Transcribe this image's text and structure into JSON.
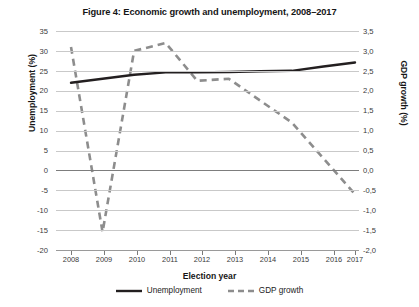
{
  "title": "Figure 4: Economic growth and unemployment, 2008–2017",
  "axes": {
    "x_title": "Election year",
    "y_left_title": "Unemployment (%)",
    "y_right_title": "GDP growth (%)",
    "x_ticklabels": [
      "2008",
      "2009",
      "2010",
      "2011",
      "2012",
      "2013",
      "2014",
      "2015",
      "2016",
      "2017"
    ],
    "y_left_ticklabels": [
      "35",
      "30",
      "25",
      "20",
      "15",
      "10",
      "5",
      "0",
      "-5",
      "-10",
      "-15",
      "-20"
    ],
    "y_right_ticklabels": [
      "3,5",
      "3,0",
      "2,5",
      "2,0",
      "1,5",
      "1,0",
      "0,5",
      "0,0",
      "-0,5",
      "-1,0",
      "-1,5",
      "-2,0"
    ]
  },
  "legend": {
    "items": [
      {
        "label": "Unemployment",
        "style": "solid",
        "color": "#231f20"
      },
      {
        "label": "GDP growth",
        "style": "dashed",
        "color": "#8d8d8d"
      }
    ]
  },
  "colors": {
    "unemployment": "#231f20",
    "gdp": "#8d8d8d",
    "grid": "#c9c9c9",
    "zero_grid": "#7d7d7d",
    "axis": "#9a9a9a",
    "text": "#1b1b1b"
  },
  "chart_data": {
    "type": "line",
    "title": "Figure 4: Economic growth and unemployment, 2008–2017",
    "xlabel": "Election year",
    "ylabel": "Unemployment (%)",
    "y2label": "GDP growth (%)",
    "x": [
      2008,
      2009,
      2010,
      2011,
      2012,
      2013,
      2014,
      2015,
      2016,
      2017
    ],
    "categories": [
      "2008",
      "2009",
      "2010",
      "2011",
      "2012",
      "2013",
      "2014",
      "2015",
      "2016",
      "2017"
    ],
    "ylim": [
      -20,
      35
    ],
    "ytick_step": 5,
    "y2lim": [
      -2.0,
      3.5
    ],
    "y2tick_step": 0.5,
    "grid": "horizontal",
    "legend_position": "bottom",
    "decimal_separator": "comma",
    "series": [
      {
        "name": "Unemployment",
        "axis": "left",
        "unit": "%",
        "style": "solid",
        "color": "#231f20",
        "values": [
          22.0,
          23.0,
          24.0,
          24.6,
          24.6,
          24.7,
          24.9,
          25.0,
          26.1,
          27.1
        ]
      },
      {
        "name": "GDP growth",
        "axis": "right",
        "unit": "%",
        "style": "dashed",
        "color": "#8d8d8d",
        "values": [
          3.1,
          -1.55,
          3.0,
          3.2,
          2.25,
          2.3,
          1.75,
          1.2,
          0.3,
          -0.6
        ]
      }
    ]
  }
}
